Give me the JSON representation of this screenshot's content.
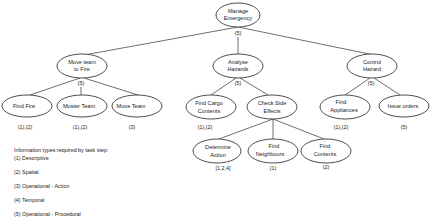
{
  "diagram": {
    "type": "hierarchical-task-analysis",
    "root": {
      "label_line1": "Manage",
      "label_line2": "Emergency",
      "plan": "(5)"
    },
    "level1": [
      {
        "label_line1": "Move team",
        "label_line2": "to Fire",
        "plan": "(5)"
      },
      {
        "label_line1": "Analyse",
        "label_line2": "Hazards",
        "plan": "(5)"
      },
      {
        "label_line1": "Control",
        "label_line2": "Hazard",
        "plan": "(5)"
      }
    ],
    "level2": [
      {
        "label_line1": "Find Fire",
        "label_line2": "",
        "info": "(1),(2)"
      },
      {
        "label_line1": "Muster Team",
        "label_line2": "",
        "info": "(1),(2)"
      },
      {
        "label_line1": "Move Team",
        "label_line2": "",
        "info": "(3)"
      },
      {
        "label_line1": "Find Cargo",
        "label_line2": "Contents",
        "info": "(1),(2)"
      },
      {
        "label_line1": "Check Side",
        "label_line2": "Effects",
        "info": ""
      },
      {
        "label_line1": "Find",
        "label_line2": "Appliances",
        "info": "(1),(2)"
      },
      {
        "label_line1": "Issue orders",
        "label_line2": "",
        "info": "(5)"
      }
    ],
    "level3": [
      {
        "label_line1": "Determine",
        "label_line2": "Action",
        "info": "[1,2,4]"
      },
      {
        "label_line1": "Find",
        "label_line2": "Neighbours",
        "info": "(1)"
      },
      {
        "label_line1": "Find",
        "label_line2": "Contents",
        "info": "(2)"
      }
    ]
  },
  "legend": {
    "title": "Information types required by task step:",
    "items": [
      "(1) Descriptive",
      "(2) Spatial",
      "(3) Operational - Action",
      "(4) Temporal",
      "(5) Operational - Procedural"
    ]
  }
}
